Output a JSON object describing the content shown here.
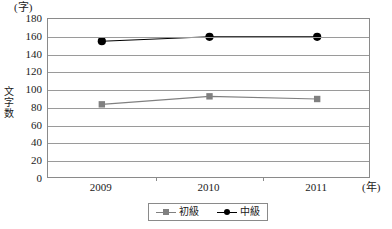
{
  "chart_data": {
    "type": "line",
    "title": "",
    "xlabel": "(年)",
    "ylabel": "文字数",
    "y_unit": "(字)",
    "x_unit": "(年)",
    "categories": [
      "2009",
      "2010",
      "2011"
    ],
    "ylim": [
      0,
      180
    ],
    "ytick_step": 20,
    "yticks": [
      "180",
      "160",
      "140",
      "120",
      "100",
      "80",
      "60",
      "40",
      "20",
      "0"
    ],
    "ytick_values": [
      180,
      160,
      140,
      120,
      100,
      80,
      60,
      40,
      20,
      0
    ],
    "grid": true,
    "legend_position": "bottom-center",
    "series": [
      {
        "name": "初級",
        "marker": "square",
        "color": "#808080",
        "values": [
          84,
          93,
          90
        ]
      },
      {
        "name": "中級",
        "marker": "circle",
        "color": "#000000",
        "values": [
          155,
          160,
          160
        ]
      }
    ]
  },
  "legend": {
    "items": [
      {
        "label": "初級"
      },
      {
        "label": "中級"
      }
    ]
  },
  "axis": {
    "y_unit_label": "(字)",
    "y_title_chars": [
      "文",
      "字",
      "数"
    ],
    "x_unit_label": "(年)"
  },
  "colors": {
    "series_beginner": "#808080",
    "series_intermediate": "#000000",
    "gridline": "#9a9a9a",
    "border": "#8a8a8a",
    "background": "#ffffff",
    "text": "#1a1a1a"
  }
}
